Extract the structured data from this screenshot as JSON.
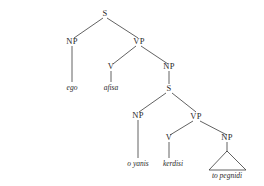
{
  "diagram": {
    "kind": "syntax-tree",
    "sentence": "ego afisa o yanis kerdisi to pegnidi",
    "background_color": "#ffffff",
    "line_color": "#3a3a3a",
    "text_color": "#2a2a2a",
    "nodes": {
      "root_s": "S",
      "subject_np": "NP",
      "matrix_vp": "VP",
      "matrix_v": "V",
      "object_np": "NP",
      "embedded_s": "S",
      "embedded_np": "NP",
      "embedded_vp": "VP",
      "embedded_v": "V",
      "embedded_object_np": "NP"
    },
    "leaves": {
      "subject": "ego",
      "matrix_verb": "afisa",
      "embedded_subject": "o yanis",
      "embedded_verb": "kerdisi",
      "embedded_object": "to pegnidi"
    }
  }
}
